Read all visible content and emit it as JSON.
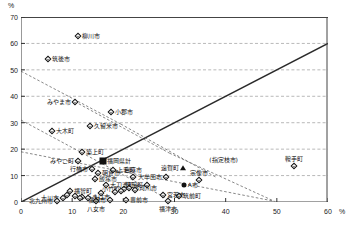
{
  "axes": {
    "y_unit": "%",
    "x_unit": "%",
    "y_ticks": [
      "0",
      "10",
      "20",
      "30",
      "40",
      "50",
      "60",
      "70"
    ],
    "x_ticks": [
      "0",
      "10",
      "20",
      "30",
      "40",
      "50",
      "60"
    ]
  },
  "chart_data": {
    "type": "scatter",
    "title": "",
    "xlabel": "",
    "ylabel": "",
    "xlim": [
      0,
      60
    ],
    "ylim": [
      0,
      70
    ],
    "grid": "horizontal-dashed",
    "legend": "none",
    "reference_lines": [
      {
        "name": "identity-line",
        "style": "solid",
        "from": [
          0,
          0
        ],
        "to": [
          60,
          60
        ]
      },
      {
        "name": "dashed-line-1",
        "style": "dashed",
        "from": [
          0,
          49.5
        ],
        "to": [
          19.5,
          29.5
        ]
      },
      {
        "name": "dashed-line-2",
        "style": "dashed",
        "from": [
          0,
          31
        ],
        "to": [
          29.5,
          0.3
        ]
      },
      {
        "name": "dashed-line-3",
        "style": "dashed",
        "from": [
          0,
          19
        ],
        "to": [
          49.5,
          0.3
        ]
      },
      {
        "name": "dashed-line-4",
        "style": "dashed",
        "from": [
          10.5,
          38
        ],
        "to": [
          29,
          18.5
        ]
      },
      {
        "name": "dashed-line-5",
        "style": "dashed",
        "from": [
          19.5,
          29.5
        ],
        "to": [
          38,
          9.5
        ]
      },
      {
        "name": "dashed-line-6",
        "style": "dashed",
        "from": [
          29,
          18.5
        ],
        "to": [
          49.5,
          0.3
        ]
      }
    ],
    "points": [
      {
        "label": "柳川市",
        "x": 11.2,
        "y": 62.8,
        "marker": "diamond",
        "label_pos": "right"
      },
      {
        "label": "筑後市",
        "x": 5.2,
        "y": 54.0,
        "marker": "diamond",
        "label_pos": "right"
      },
      {
        "label": "みやま市",
        "x": 10.6,
        "y": 38.0,
        "marker": "diamond",
        "label_pos": "left"
      },
      {
        "label": "小郡市",
        "x": 17.6,
        "y": 34.0,
        "marker": "diamond",
        "label_pos": "right"
      },
      {
        "label": "久留米市",
        "x": 13.4,
        "y": 28.7,
        "marker": "diamond",
        "label_pos": "right"
      },
      {
        "label": "大木町",
        "x": 6.0,
        "y": 26.8,
        "marker": "diamond",
        "label_pos": "right"
      },
      {
        "label": "築上町",
        "x": 12.0,
        "y": 19.0,
        "marker": "diamond",
        "label_pos": "right"
      },
      {
        "label": "みやこ町",
        "x": 11.2,
        "y": 15.7,
        "marker": "diamond",
        "label_pos": "left"
      },
      {
        "label": "福岡県計",
        "x": 16.0,
        "y": 15.5,
        "marker": "square",
        "label_pos": "right"
      },
      {
        "label": "鞍手町",
        "x": 53.4,
        "y": 13.8,
        "marker": "diamond",
        "label_pos": "above"
      },
      {
        "label": "遠賀町",
        "x": 31.6,
        "y": 12.8,
        "marker": "triangle",
        "label_pos": "left"
      },
      {
        "label": "上毛町",
        "x": 18.0,
        "y": 12.2,
        "marker": "diamond",
        "label_pos": "right"
      },
      {
        "label": "行橋市",
        "x": 13.8,
        "y": 12.4,
        "marker": "diamond",
        "label_pos": "left"
      },
      {
        "label": "朝倉市",
        "x": 15.0,
        "y": 11.0,
        "marker": "diamond",
        "label_pos": "right"
      },
      {
        "label": "(指定枝市)",
        "x": 36.0,
        "y": 16.0,
        "marker": "none",
        "label_pos": "right"
      },
      {
        "label": "宗像市",
        "x": 34.7,
        "y": 8.4,
        "marker": "diamond",
        "label_pos": "above"
      },
      {
        "label": "嘉麻市",
        "x": 21.8,
        "y": 9.6,
        "marker": "diamond",
        "label_pos": "above"
      },
      {
        "label": "大牟田市",
        "x": 28.4,
        "y": 9.6,
        "marker": "diamond",
        "label_pos": "left"
      },
      {
        "label": "飯塚市",
        "x": 14.4,
        "y": 8.6,
        "marker": "diamond",
        "label_pos": "right"
      },
      {
        "label": "A市",
        "x": 31.8,
        "y": 6.3,
        "marker": "circle",
        "label_pos": "right"
      },
      {
        "label": "小竹町",
        "x": 20.2,
        "y": 5.0,
        "marker": "diamond",
        "label_pos": "left"
      },
      {
        "label": "苅田町",
        "x": 24.6,
        "y": 6.6,
        "marker": "diamond",
        "label_pos": "left"
      },
      {
        "label": "那珂川市",
        "x": 21.2,
        "y": 5.4,
        "marker": "diamond",
        "label_pos": "right"
      },
      {
        "label": "大刀洗町",
        "x": 16.6,
        "y": 6.6,
        "marker": "diamond",
        "label_pos": "right"
      },
      {
        "label": "福智町",
        "x": 9.6,
        "y": 4.2,
        "marker": "diamond",
        "label_pos": "right"
      },
      {
        "label": "筑前町",
        "x": 30.8,
        "y": 2.4,
        "marker": "diamond",
        "label_pos": "right"
      },
      {
        "label": "宮若市",
        "x": 27.8,
        "y": 2.6,
        "marker": "diamond",
        "label_pos": "right"
      },
      {
        "label": "うきは市",
        "x": 12.0,
        "y": 2.0,
        "marker": "diamond",
        "label_pos": "right"
      },
      {
        "label": "大川市",
        "x": 8.2,
        "y": 1.4,
        "marker": "diamond",
        "label_pos": "left"
      },
      {
        "label": "北九州市",
        "x": 7.0,
        "y": 0.4,
        "marker": "diamond",
        "label_pos": "left"
      },
      {
        "label": "八女市",
        "x": 14.6,
        "y": 0.3,
        "marker": "diamond",
        "label_pos": "below"
      },
      {
        "label": "福岡市",
        "x": 17.4,
        "y": 0.6,
        "marker": "diamond",
        "label_pos": "left"
      },
      {
        "label": "豊前市",
        "x": 20.6,
        "y": 0.6,
        "marker": "diamond",
        "label_pos": "right"
      },
      {
        "label": "福津市",
        "x": 28.8,
        "y": 0.3,
        "marker": "diamond",
        "label_pos": "below"
      },
      {
        "label": "",
        "x": 10.6,
        "y": 2.2,
        "marker": "diamond",
        "label_pos": "none"
      },
      {
        "label": "",
        "x": 11.6,
        "y": 1.4,
        "marker": "diamond",
        "label_pos": "none"
      },
      {
        "label": "",
        "x": 13.0,
        "y": 1.5,
        "marker": "diamond",
        "label_pos": "none"
      },
      {
        "label": "",
        "x": 15.6,
        "y": 3.3,
        "marker": "diamond",
        "label_pos": "none"
      },
      {
        "label": "",
        "x": 18.4,
        "y": 3.6,
        "marker": "diamond",
        "label_pos": "none"
      },
      {
        "label": "",
        "x": 19.6,
        "y": 4.2,
        "marker": "diamond",
        "label_pos": "none"
      },
      {
        "label": "",
        "x": 22.2,
        "y": 4.6,
        "marker": "diamond",
        "label_pos": "none"
      },
      {
        "label": "",
        "x": 9.0,
        "y": 2.8,
        "marker": "diamond",
        "label_pos": "none"
      }
    ]
  }
}
